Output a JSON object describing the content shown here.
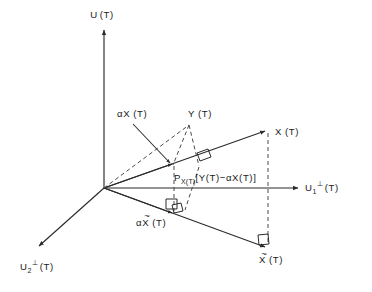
{
  "figure": {
    "kind": "vector-projection-diagram",
    "background_color": "#ffffff",
    "line_color": "#2b2b2b",
    "dash_color": "#4a4a4a",
    "text_color": "#1a1a1a"
  },
  "axes": {
    "vertical": {
      "name": "U(T)",
      "label_main": "U",
      "label_paren": "(T)",
      "direction": "up"
    },
    "right": {
      "name": "U1perp(T)",
      "label_main": "U",
      "label_sub": "1",
      "label_sup": "⊥",
      "label_paren": "(T)",
      "direction": "right"
    },
    "lower_left": {
      "name": "U2perp(T)",
      "label_main": "U",
      "label_sub": "2",
      "label_sup": "⊥",
      "label_paren": "(T)",
      "direction": "down-left"
    }
  },
  "vectors": {
    "x": {
      "label_main": "X",
      "label_paren": "(T)",
      "full": "X (T)"
    },
    "y": {
      "label_main": "Y",
      "label_paren": "(T)",
      "full": "Y (T)"
    },
    "alpha_x": {
      "label_alpha": "α",
      "label_main": "X",
      "label_paren": "(T)",
      "full": "αX (T)"
    },
    "x_tilde": {
      "label_main": "X",
      "label_paren": "(T)",
      "tilde": "~",
      "full": "X̃ (T)"
    },
    "alpha_x_tilde": {
      "label_alpha": "α",
      "label_main": "X",
      "label_paren": "(T)",
      "tilde": "~",
      "full": "αX̃ (T)"
    }
  },
  "projection": {
    "operator": "P",
    "operator_sub": "X(T)",
    "bracket_open": "[",
    "expression": "Y(T)−αX(T)",
    "bracket_close": "]",
    "full": "P_X(T)[Y(T)−αX(T)]"
  },
  "markers": {
    "right_angle_count": 4,
    "right_angle_note": "∟"
  }
}
